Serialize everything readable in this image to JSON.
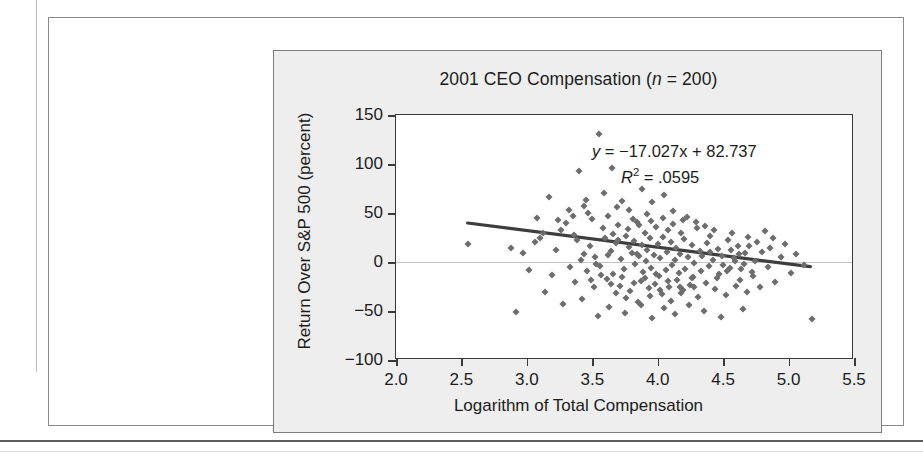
{
  "figure": {
    "title_main": "2001 CEO Compensation (",
    "title_n_var": "n",
    "title_n_rest": " = 200)"
  },
  "annotations": {
    "equation_y": "y",
    "equation_rest": " = −17.027x + 82.737",
    "r_symbol": "R",
    "r_exponent": "2",
    "r_rest": " = .0595"
  },
  "chart_data": {
    "type": "scatter",
    "title": "2001 CEO Compensation (n = 200)",
    "xlabel": "Logarithm of Total Compensation",
    "ylabel": "Return Over S&P 500 (percent)",
    "xlim": [
      2.0,
      5.5
    ],
    "ylim": [
      -100,
      150
    ],
    "xticks": [
      2.0,
      2.5,
      3.0,
      3.5,
      4.0,
      4.5,
      5.0,
      5.5
    ],
    "xtick_labels": [
      "2.0",
      "2.5",
      "3.0",
      "3.5",
      "4.0",
      "4.5",
      "5.0",
      "5.5"
    ],
    "yticks": [
      150,
      100,
      50,
      0,
      -50,
      -100
    ],
    "ytick_labels": [
      "150",
      "100",
      "50",
      "0",
      "−50",
      "−100"
    ],
    "grid": false,
    "legend": null,
    "n": 200,
    "marker": {
      "shape": "diamond",
      "color": "#6d6d6d",
      "size": 5
    },
    "reference_line": {
      "y": 0,
      "color": "#c4c4c4"
    },
    "trendline": {
      "type": "linear",
      "slope": -17.027,
      "intercept": 82.737,
      "r_squared": 0.0595,
      "equation_text": "y = −17.027x + 82.737",
      "r_squared_text": "R² = .0595",
      "color": "#3d3d3d",
      "x_start": 2.55,
      "x_end": 5.18
    },
    "points": [
      [
        3.55,
        131
      ],
      [
        3.4,
        93
      ],
      [
        3.65,
        96
      ],
      [
        3.17,
        66
      ],
      [
        3.44,
        57
      ],
      [
        3.73,
        62
      ],
      [
        3.88,
        74
      ],
      [
        3.96,
        61
      ],
      [
        4.05,
        68
      ],
      [
        3.62,
        47
      ],
      [
        3.3,
        40
      ],
      [
        3.5,
        44
      ],
      [
        3.78,
        53
      ],
      [
        3.92,
        49
      ],
      [
        4.12,
        52
      ],
      [
        4.22,
        46
      ],
      [
        3.36,
        28
      ],
      [
        3.58,
        35
      ],
      [
        3.7,
        38
      ],
      [
        3.84,
        41
      ],
      [
        3.99,
        36
      ],
      [
        4.08,
        33
      ],
      [
        4.18,
        30
      ],
      [
        4.3,
        35
      ],
      [
        4.4,
        27
      ],
      [
        2.55,
        18
      ],
      [
        2.88,
        14
      ],
      [
        3.06,
        20
      ],
      [
        3.22,
        12
      ],
      [
        3.38,
        22
      ],
      [
        3.48,
        16
      ],
      [
        3.6,
        25
      ],
      [
        3.68,
        19
      ],
      [
        3.76,
        27
      ],
      [
        3.82,
        21
      ],
      [
        3.9,
        30
      ],
      [
        3.94,
        24
      ],
      [
        4.0,
        18
      ],
      [
        4.04,
        26
      ],
      [
        4.1,
        20
      ],
      [
        4.14,
        14
      ],
      [
        4.2,
        23
      ],
      [
        4.26,
        17
      ],
      [
        4.32,
        11
      ],
      [
        4.38,
        19
      ],
      [
        4.46,
        13
      ],
      [
        4.54,
        22
      ],
      [
        4.62,
        8
      ],
      [
        4.7,
        16
      ],
      [
        4.8,
        10
      ],
      [
        3.44,
        8
      ],
      [
        3.52,
        5
      ],
      [
        3.64,
        11
      ],
      [
        3.72,
        3
      ],
      [
        3.8,
        9
      ],
      [
        3.86,
        6
      ],
      [
        3.91,
        1
      ],
      [
        3.97,
        7
      ],
      [
        4.02,
        4
      ],
      [
        4.07,
        10
      ],
      [
        4.13,
        2
      ],
      [
        4.17,
        8
      ],
      [
        4.23,
        5
      ],
      [
        4.28,
        -1
      ],
      [
        4.34,
        6
      ],
      [
        4.42,
        2
      ],
      [
        4.5,
        -3
      ],
      [
        4.58,
        4
      ],
      [
        4.66,
        -2
      ],
      [
        4.74,
        1
      ],
      [
        3.33,
        -5
      ],
      [
        3.46,
        -9
      ],
      [
        3.56,
        -4
      ],
      [
        3.66,
        -12
      ],
      [
        3.74,
        -7
      ],
      [
        3.83,
        -2
      ],
      [
        3.89,
        -10
      ],
      [
        3.95,
        -6
      ],
      [
        4.01,
        -14
      ],
      [
        4.06,
        -8
      ],
      [
        4.11,
        -3
      ],
      [
        4.16,
        -11
      ],
      [
        4.21,
        -7
      ],
      [
        4.27,
        -15
      ],
      [
        4.33,
        -9
      ],
      [
        4.39,
        -4
      ],
      [
        4.47,
        -12
      ],
      [
        4.55,
        -6
      ],
      [
        4.63,
        -18
      ],
      [
        4.72,
        -10
      ],
      [
        3.37,
        -20
      ],
      [
        3.51,
        -26
      ],
      [
        3.61,
        -17
      ],
      [
        3.71,
        -24
      ],
      [
        3.79,
        -30
      ],
      [
        3.87,
        -19
      ],
      [
        3.93,
        -27
      ],
      [
        3.98,
        -22
      ],
      [
        4.03,
        -33
      ],
      [
        4.09,
        -25
      ],
      [
        4.15,
        -18
      ],
      [
        4.19,
        -29
      ],
      [
        4.25,
        -23
      ],
      [
        4.31,
        -36
      ],
      [
        4.37,
        -21
      ],
      [
        4.44,
        -28
      ],
      [
        4.52,
        -34
      ],
      [
        4.6,
        -24
      ],
      [
        4.68,
        -31
      ],
      [
        4.78,
        -26
      ],
      [
        2.92,
        -51
      ],
      [
        3.14,
        -31
      ],
      [
        3.28,
        -43
      ],
      [
        3.42,
        -38
      ],
      [
        3.54,
        -55
      ],
      [
        3.63,
        -46
      ],
      [
        3.75,
        -52
      ],
      [
        3.85,
        -41
      ],
      [
        3.96,
        -57
      ],
      [
        4.05,
        -47
      ],
      [
        4.13,
        -53
      ],
      [
        4.24,
        -44
      ],
      [
        4.35,
        -50
      ],
      [
        4.48,
        -56
      ],
      [
        4.65,
        -48
      ],
      [
        5.18,
        -58
      ],
      [
        5.02,
        -11
      ],
      [
        4.94,
        5
      ],
      [
        4.86,
        14
      ],
      [
        4.9,
        -20
      ],
      [
        4.84,
        -5
      ],
      [
        4.76,
        20
      ],
      [
        4.69,
        26
      ],
      [
        4.61,
        16
      ],
      [
        4.57,
        30
      ],
      [
        3.59,
        70
      ],
      [
        3.47,
        50
      ],
      [
        3.69,
        56
      ],
      [
        3.81,
        44
      ],
      [
        3.35,
        47
      ],
      [
        3.26,
        33
      ],
      [
        3.1,
        24
      ],
      [
        2.97,
        9
      ],
      [
        3.02,
        -8
      ],
      [
        3.19,
        -13
      ],
      [
        3.88,
        17
      ],
      [
        3.92,
        12
      ],
      [
        3.84,
        8
      ],
      [
        3.78,
        15
      ],
      [
        3.7,
        22
      ],
      [
        3.66,
        29
      ],
      [
        3.77,
        34
      ],
      [
        3.86,
        38
      ],
      [
        3.95,
        42
      ],
      [
        4.04,
        45
      ],
      [
        4.12,
        39
      ],
      [
        4.19,
        43
      ],
      [
        4.29,
        41
      ],
      [
        4.36,
        37
      ],
      [
        4.43,
        33
      ],
      [
        3.9,
        -16
      ],
      [
        3.99,
        -12
      ],
      [
        4.08,
        -19
      ],
      [
        4.17,
        -25
      ],
      [
        4.26,
        -16
      ],
      [
        3.82,
        -21
      ],
      [
        3.73,
        -15
      ],
      [
        3.64,
        -22
      ],
      [
        3.57,
        -13
      ],
      [
        3.49,
        -18
      ],
      [
        4.4,
        10
      ],
      [
        4.49,
        6
      ],
      [
        4.56,
        12
      ],
      [
        4.64,
        -7
      ],
      [
        4.73,
        -14
      ],
      [
        3.41,
        2
      ],
      [
        3.53,
        -2
      ],
      [
        3.62,
        7
      ],
      [
        3.94,
        -35
      ],
      [
        4.02,
        -29
      ],
      [
        4.1,
        -40
      ],
      [
        4.18,
        -32
      ],
      [
        4.28,
        -26
      ],
      [
        3.87,
        -44
      ],
      [
        3.76,
        -37
      ],
      [
        3.68,
        -32
      ],
      [
        4.45,
        -16
      ],
      [
        4.53,
        -9
      ],
      [
        4.59,
        1
      ],
      [
        4.67,
        9
      ],
      [
        3.45,
        63
      ],
      [
        3.32,
        53
      ],
      [
        3.24,
        43
      ],
      [
        3.12,
        30
      ],
      [
        3.08,
        45
      ],
      [
        4.88,
        24
      ],
      [
        4.97,
        18
      ],
      [
        5.06,
        8
      ],
      [
        5.12,
        -3
      ],
      [
        4.82,
        32
      ]
    ]
  }
}
